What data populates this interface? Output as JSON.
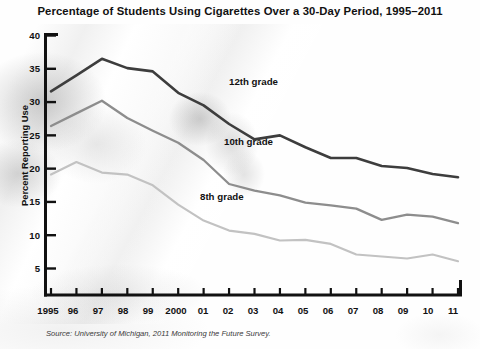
{
  "chart_data": {
    "type": "line",
    "title": "Percentage of Students Using Cigarettes Over a 30-Day Period, 1995–2011",
    "xlabel": "",
    "ylabel": "Percent Reporting Use",
    "source": "Source: University of Michigan, 2011 Monitoring the Future Survey.",
    "x": [
      1995,
      1996,
      1997,
      1998,
      1999,
      2000,
      2001,
      2002,
      2003,
      2004,
      2005,
      2006,
      2007,
      2008,
      2009,
      2010,
      2011
    ],
    "categories": [
      "1995",
      "96",
      "97",
      "98",
      "99",
      "2000",
      "01",
      "02",
      "03",
      "04",
      "05",
      "06",
      "07",
      "08",
      "09",
      "10",
      "11"
    ],
    "ylim": [
      0,
      40
    ],
    "xlim": [
      1995,
      2011
    ],
    "yticks": [
      5,
      10,
      15,
      20,
      25,
      30,
      35,
      40
    ],
    "grid": false,
    "legend_position": "inline-annotations",
    "series": [
      {
        "name": "12th grade",
        "color": "#3d3d3d",
        "values": [
          31.6,
          34.0,
          36.5,
          35.1,
          34.6,
          31.4,
          29.5,
          26.7,
          24.4,
          25.0,
          23.2,
          21.6,
          21.6,
          20.4,
          20.1,
          19.2,
          18.7
        ]
      },
      {
        "name": "10th grade",
        "color": "#8d8d8d",
        "values": [
          26.4,
          28.3,
          30.2,
          27.6,
          25.7,
          23.9,
          21.3,
          17.7,
          16.7,
          16.0,
          14.9,
          14.5,
          14.0,
          12.3,
          13.1,
          12.8,
          11.8
        ]
      },
      {
        "name": "8th grade",
        "color": "#c2c2c2",
        "values": [
          19.1,
          21.0,
          19.4,
          19.1,
          17.5,
          14.6,
          12.2,
          10.7,
          10.2,
          9.2,
          9.3,
          8.7,
          7.1,
          6.8,
          6.5,
          7.1,
          6.1
        ]
      }
    ],
    "annotations": [
      {
        "text": "12th grade",
        "x": 229,
        "y": 76
      },
      {
        "text": "10th grade",
        "x": 224,
        "y": 136
      },
      {
        "text": "8th grade",
        "x": 200,
        "y": 191
      }
    ]
  }
}
